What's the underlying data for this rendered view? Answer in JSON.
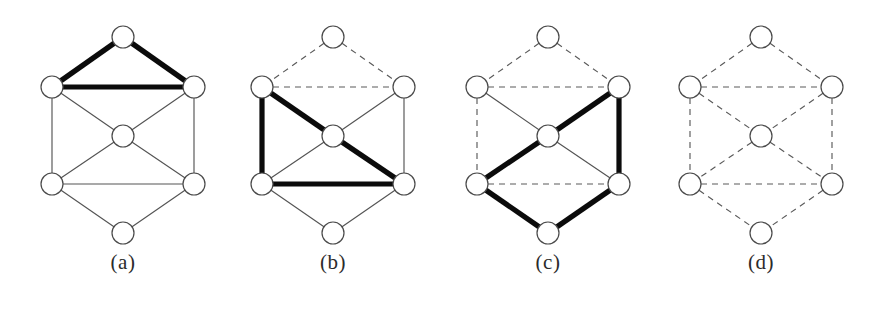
{
  "figure": {
    "background_color": "#ffffff",
    "thin_edge_color": "#545454",
    "bold_edge_color": "#0b0b0b",
    "dashed_edge_color": "#5a5a5a",
    "node_fill_color": "#ffffff",
    "node_stroke_color": "#4a4a4a",
    "node_radius": 11,
    "panel_offsets": [
      0,
      210,
      425,
      638
    ],
    "nodes": {
      "top": {
        "x": 123,
        "y": 37
      },
      "upper_left": {
        "x": 52,
        "y": 87
      },
      "upper_right": {
        "x": 194,
        "y": 87
      },
      "center": {
        "x": 123,
        "y": 136
      },
      "lower_left": {
        "x": 52,
        "y": 184
      },
      "lower_right": {
        "x": 194,
        "y": 184
      },
      "bottom": {
        "x": 123,
        "y": 233
      }
    },
    "node_order": [
      "top",
      "upper_left",
      "upper_right",
      "center",
      "lower_left",
      "lower_right",
      "bottom"
    ],
    "edge_list": [
      [
        "top",
        "upper_left"
      ],
      [
        "top",
        "upper_right"
      ],
      [
        "upper_left",
        "upper_right"
      ],
      [
        "upper_left",
        "center"
      ],
      [
        "upper_right",
        "center"
      ],
      [
        "upper_left",
        "lower_left"
      ],
      [
        "upper_right",
        "lower_right"
      ],
      [
        "center",
        "lower_left"
      ],
      [
        "center",
        "lower_right"
      ],
      [
        "lower_left",
        "lower_right"
      ],
      [
        "lower_left",
        "bottom"
      ],
      [
        "lower_right",
        "bottom"
      ]
    ]
  },
  "panels": [
    {
      "id": "panel-a",
      "caption": "(a)",
      "edge_styles": {
        "top-upper_left": "bold",
        "top-upper_right": "bold",
        "upper_left-upper_right": "bold",
        "upper_left-center": "thin",
        "upper_right-center": "thin",
        "upper_left-lower_left": "thin",
        "upper_right-lower_right": "thin",
        "center-lower_left": "thin",
        "center-lower_right": "thin",
        "lower_left-lower_right": "thin",
        "lower_left-bottom": "thin",
        "lower_right-bottom": "thin"
      }
    },
    {
      "id": "panel-b",
      "caption": "(b)",
      "edge_styles": {
        "top-upper_left": "dashed",
        "top-upper_right": "dashed",
        "upper_left-upper_right": "dashed",
        "upper_left-center": "bold",
        "upper_right-center": "thin",
        "upper_left-lower_left": "bold",
        "upper_right-lower_right": "thin",
        "center-lower_left": "thin",
        "center-lower_right": "bold",
        "lower_left-lower_right": "bold",
        "lower_left-bottom": "thin",
        "lower_right-bottom": "thin"
      }
    },
    {
      "id": "panel-c",
      "caption": "(c)",
      "edge_styles": {
        "top-upper_left": "dashed",
        "top-upper_right": "dashed",
        "upper_left-upper_right": "dashed",
        "upper_left-center": "thin",
        "upper_right-center": "bold",
        "upper_left-lower_left": "dashed",
        "upper_right-lower_right": "bold",
        "center-lower_left": "bold",
        "center-lower_right": "thin",
        "lower_left-lower_right": "dashed",
        "lower_left-bottom": "bold",
        "lower_right-bottom": "bold"
      }
    },
    {
      "id": "panel-d",
      "caption": "(d)",
      "edge_styles": {
        "top-upper_left": "dashed",
        "top-upper_right": "dashed",
        "upper_left-upper_right": "dashed",
        "upper_left-center": "dashed",
        "upper_right-center": "dashed",
        "upper_left-lower_left": "dashed",
        "upper_right-lower_right": "dashed",
        "center-lower_left": "dashed",
        "center-lower_right": "dashed",
        "lower_left-lower_right": "dashed",
        "lower_left-bottom": "dashed",
        "lower_right-bottom": "dashed"
      }
    }
  ]
}
